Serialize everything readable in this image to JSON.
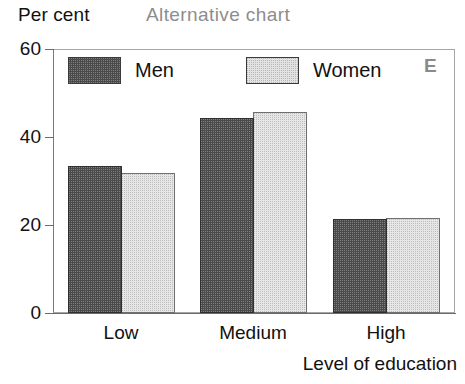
{
  "chart_data": {
    "type": "bar",
    "title": "Alternative  chart",
    "ylabel": "Per cent",
    "xlabel": "Level of education",
    "categories": [
      "Low",
      "Medium",
      "High"
    ],
    "series": [
      {
        "name": "Men",
        "values": [
          33.5,
          44.3,
          21.3
        ],
        "color": "#4a4a4a"
      },
      {
        "name": "Women",
        "values": [
          31.8,
          45.6,
          21.6
        ],
        "color": "#e6e6e6"
      }
    ],
    "ylim": [
      0,
      60
    ],
    "yticks": [
      0,
      20,
      40,
      60
    ],
    "ytick_labels": [
      "0",
      "20",
      "40",
      "60"
    ],
    "grid": false,
    "legend_position": "top-left-inside",
    "corner_marker": "E"
  }
}
